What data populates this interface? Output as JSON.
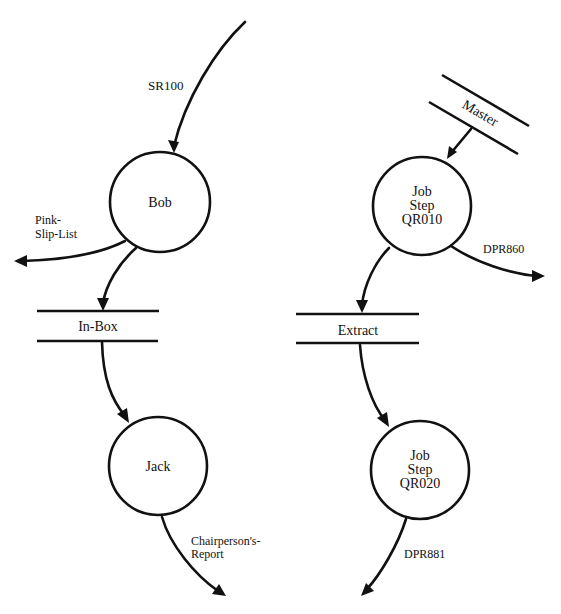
{
  "diagram": {
    "type": "data-flow-diagram",
    "processes": [
      {
        "id": "bob",
        "label_lines": [
          "Bob"
        ]
      },
      {
        "id": "jack",
        "label_lines": [
          "Jack"
        ]
      },
      {
        "id": "qr010",
        "label_lines": [
          "Job",
          "Step",
          "QR010"
        ]
      },
      {
        "id": "qr020",
        "label_lines": [
          "Job",
          "Step",
          "QR020"
        ]
      }
    ],
    "stores": [
      {
        "id": "inbox",
        "label": "In-Box"
      },
      {
        "id": "extract",
        "label": "Extract"
      },
      {
        "id": "master",
        "label": "Master"
      }
    ],
    "flows": [
      {
        "id": "sr100",
        "label_lines": [
          "SR100"
        ],
        "from": "",
        "to": "bob"
      },
      {
        "id": "pinkslip",
        "label_lines": [
          "Pink-",
          "Slip-List"
        ],
        "from": "bob",
        "to": ""
      },
      {
        "id": "bob-inbox",
        "label_lines": [],
        "from": "bob",
        "to": "inbox"
      },
      {
        "id": "inbox-jack",
        "label_lines": [],
        "from": "inbox",
        "to": "jack"
      },
      {
        "id": "chair",
        "label_lines": [
          "Chairperson's-",
          "Report"
        ],
        "from": "jack",
        "to": ""
      },
      {
        "id": "master-qr010",
        "label_lines": [],
        "from": "master",
        "to": "qr010"
      },
      {
        "id": "dpr860",
        "label_lines": [
          "DPR860"
        ],
        "from": "qr010",
        "to": ""
      },
      {
        "id": "qr010-extract",
        "label_lines": [],
        "from": "qr010",
        "to": "extract"
      },
      {
        "id": "extract-qr020",
        "label_lines": [],
        "from": "extract",
        "to": "qr020"
      },
      {
        "id": "dpr881",
        "label_lines": [
          "DPR881"
        ],
        "from": "qr020",
        "to": ""
      }
    ]
  },
  "colors": {
    "ink": "#111111",
    "background": "#ffffff"
  }
}
